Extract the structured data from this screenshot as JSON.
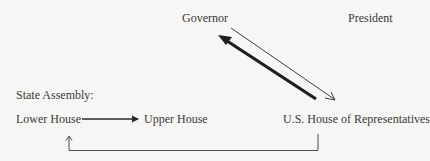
{
  "diagram": {
    "nodes": {
      "governor": "Governor",
      "president": "President",
      "state_assembly_heading": "State Assembly:",
      "lower_house": "Lower House",
      "upper_house": "Upper House",
      "us_house": "U.S. House of Representatives"
    },
    "edges": [
      {
        "from": "us_house",
        "to": "governor",
        "style": "thick"
      },
      {
        "from": "governor",
        "to": "us_house",
        "style": "thin"
      },
      {
        "from": "lower_house",
        "to": "upper_house",
        "style": "medium"
      },
      {
        "from": "us_house",
        "to": "lower_house",
        "style": "thin-elbow"
      }
    ],
    "colors": {
      "background": "#f6f6f4",
      "text": "#3a3a3a",
      "line": "#2a2a2a"
    }
  }
}
